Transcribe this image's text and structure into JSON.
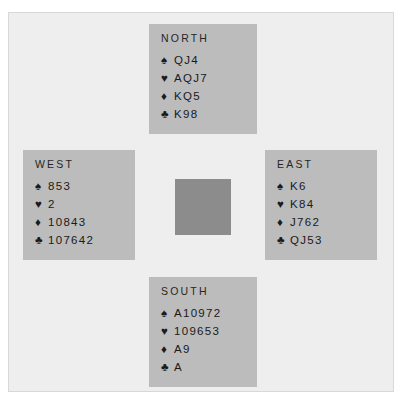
{
  "diagram": {
    "type": "bridge-deal",
    "suit_symbols": {
      "spades": "♠",
      "hearts": "♥",
      "diamonds": "♦",
      "clubs": "♣"
    },
    "colors": {
      "background": "#eeeeee",
      "hand_panel": "#bcbcbc",
      "center_square": "#8c8c8c",
      "text": "#1a1a1a",
      "border": "#d8d8d8"
    },
    "hands": {
      "north": {
        "label": "NORTH",
        "spades": "QJ4",
        "hearts": "AQJ7",
        "diamonds": "KQ5",
        "clubs": "K98"
      },
      "west": {
        "label": "WEST",
        "spades": "853",
        "hearts": "2",
        "diamonds": "10843",
        "clubs": "107642"
      },
      "east": {
        "label": "EAST",
        "spades": "K6",
        "hearts": "K84",
        "diamonds": "J762",
        "clubs": "QJ53"
      },
      "south": {
        "label": "SOUTH",
        "spades": "A10972",
        "hearts": "109653",
        "diamonds": "A9",
        "clubs": "A"
      }
    }
  }
}
